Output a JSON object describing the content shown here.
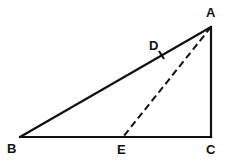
{
  "diagram": {
    "type": "geometry",
    "title": "",
    "colors": {
      "stroke": "#111111",
      "background": "#ffffff"
    },
    "points": {
      "A": {
        "label": "A",
        "x": 211,
        "y": 27
      },
      "B": {
        "label": "B",
        "x": 20,
        "y": 137
      },
      "C": {
        "label": "C",
        "x": 211,
        "y": 137
      },
      "D": {
        "label": "D",
        "x": 162,
        "y": 55
      },
      "E": {
        "label": "E",
        "x": 123,
        "y": 137
      }
    },
    "segments": [
      {
        "from": "A",
        "to": "B",
        "style": "solid"
      },
      {
        "from": "B",
        "to": "C",
        "style": "solid"
      },
      {
        "from": "C",
        "to": "A",
        "style": "solid"
      },
      {
        "from": "A",
        "to": "E",
        "style": "dashed"
      }
    ],
    "marks": [
      {
        "type": "tick",
        "at": "D",
        "on_segment": "AB"
      }
    ],
    "right_angle_at": "C"
  }
}
